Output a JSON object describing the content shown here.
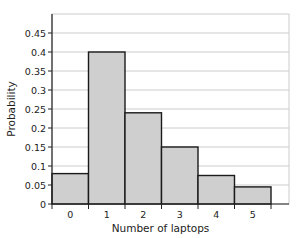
{
  "chart_data": {
    "type": "bar",
    "title": "",
    "xlabel": "Number of laptops",
    "ylabel": "Probability",
    "categories": [
      "0",
      "1",
      "2",
      "3",
      "4",
      "5"
    ],
    "values": [
      0.08,
      0.4,
      0.24,
      0.15,
      0.075,
      0.045
    ],
    "yticks": [
      "0",
      "0.05",
      "0.1",
      "0.15",
      "0.2",
      "0.25",
      "0.3",
      "0.35",
      "0.4",
      "0.45"
    ],
    "ylim": [
      0,
      0.5
    ],
    "grid": true,
    "legend": null,
    "bar_color": "#cfcfcf",
    "bar_edge_color": "#1a1a1a",
    "grid_color": "#cccccc"
  }
}
